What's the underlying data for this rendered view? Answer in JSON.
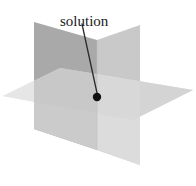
{
  "figure": {
    "background_color": "#ffffff",
    "label": {
      "text": "solution",
      "x": 60,
      "y": 26,
      "font_size_px": 15,
      "color": "#1a1a1a"
    },
    "leader_line": {
      "from_x": 82,
      "from_y": 24,
      "to_x": 97,
      "to_y": 93,
      "color": "#2a2a2a",
      "width_px": 1.3
    },
    "solution_point": {
      "x": 97,
      "y": 97,
      "radius_px": 4.2,
      "color": "#111111"
    },
    "colors": {
      "dark": "#a9a9a9",
      "mid_dark": "#bcbcbc",
      "mid": "#c9c9c9",
      "mid_light": "#d8d8d8",
      "light": "#e3e3e3",
      "lightest": "#ededed"
    },
    "planes": [
      {
        "name": "vertical-plane-left",
        "description": "rear-left vertical plane tilting down to the right",
        "fill": "#a9a9a9",
        "points": "34,22 97,40 97,150 34,129"
      },
      {
        "name": "vertical-plane-right",
        "description": "rear-right vertical plane tilting down to the left",
        "fill": "#c9c9c9",
        "points": "140,25 97,40 97,150 140,165"
      },
      {
        "name": "horizontal-plane",
        "description": "wide flat horizontal plane seen edge-on in perspective",
        "fill": "#d8d8d8",
        "points": "3,96 60,68 193,90 133,120"
      }
    ]
  }
}
